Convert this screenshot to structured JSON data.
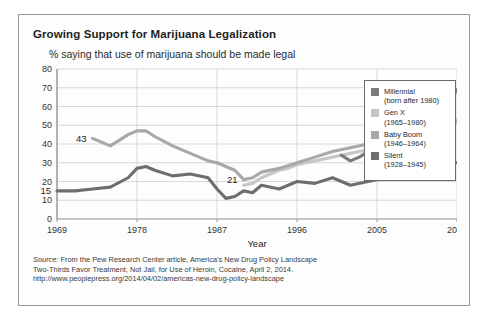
{
  "chart_data": {
    "type": "line",
    "title": "Growing Support for Marijuana Legalization",
    "subtitle": "% saying that use of marijuana should be made legal",
    "xlabel": "Year",
    "ylabel": "",
    "xlim": [
      1969,
      2014
    ],
    "ylim": [
      0,
      80
    ],
    "yticks": [
      "0",
      "10",
      "20",
      "30",
      "40",
      "50",
      "60",
      "70",
      "80"
    ],
    "xticks": [
      "1969",
      "1978",
      "1987",
      "1996",
      "2005",
      "2014"
    ],
    "grid": true,
    "legend_position": "right",
    "series": [
      {
        "name": "Millennial",
        "sublabel": "(born after 1980)",
        "color": "#7a7a7a",
        "end_label": "69",
        "x": [
          2001,
          2002,
          2003,
          2004,
          2005,
          2006,
          2007,
          2008,
          2009,
          2010,
          2011,
          2012,
          2013,
          2014
        ],
        "values": [
          34,
          31,
          33,
          36,
          34,
          34,
          36,
          36,
          42,
          48,
          51,
          58,
          62,
          69
        ]
      },
      {
        "name": "Gen X",
        "sublabel": "(1965–1980)",
        "color": "#c6c6c6",
        "end_label": "53",
        "x": [
          1990,
          1991,
          1992,
          1993,
          1994,
          1995,
          1996,
          1997,
          1998,
          1999,
          2000,
          2001,
          2002,
          2003,
          2004,
          2005,
          2006,
          2007,
          2008,
          2009,
          2010,
          2011,
          2012,
          2013,
          2014
        ],
        "values": [
          18,
          19,
          22,
          24,
          26,
          27,
          29,
          30,
          31,
          32,
          33,
          34,
          35,
          36,
          37,
          38,
          40,
          41,
          40,
          42,
          44,
          45,
          47,
          50,
          53
        ]
      },
      {
        "name": "Baby Boom",
        "sublabel": "(1946–1964)",
        "color": "#a8a8a8",
        "start_label": "43",
        "mid_label": "21",
        "end_label": "52",
        "x": [
          1973,
          1975,
          1977,
          1978,
          1979,
          1980,
          1982,
          1984,
          1986,
          1987,
          1988,
          1989,
          1990,
          1991,
          1992,
          1994,
          1996,
          1998,
          2000,
          2002,
          2004,
          2005,
          2006,
          2007,
          2008,
          2009,
          2010,
          2011,
          2012,
          2013,
          2014
        ],
        "values": [
          43,
          39,
          45,
          47,
          47,
          44,
          39,
          35,
          31,
          30,
          28,
          26,
          21,
          22,
          25,
          27,
          30,
          33,
          36,
          38,
          40,
          41,
          41,
          40,
          38,
          39,
          42,
          44,
          46,
          49,
          52
        ]
      },
      {
        "name": "Silent",
        "sublabel": "(1928–1945)",
        "color": "#6e6e6e",
        "start_label": "15",
        "end_label": "30",
        "x": [
          1969,
          1971,
          1973,
          1975,
          1977,
          1978,
          1979,
          1980,
          1982,
          1984,
          1986,
          1987,
          1988,
          1989,
          1990,
          1991,
          1992,
          1994,
          1996,
          1998,
          2000,
          2002,
          2004,
          2006,
          2008,
          2010,
          2012,
          2013,
          2014
        ],
        "values": [
          15,
          15,
          16,
          17,
          22,
          27,
          28,
          26,
          23,
          24,
          22,
          16,
          11,
          12,
          15,
          14,
          18,
          16,
          20,
          19,
          22,
          18,
          20,
          22,
          23,
          25,
          27,
          31,
          30
        ]
      }
    ],
    "annotations": [
      {
        "text": "43",
        "series": "Baby Boom",
        "x": 1973,
        "y": 43
      },
      {
        "text": "15",
        "series": "Silent",
        "x": 1969,
        "y": 15
      },
      {
        "text": "21",
        "series": "Baby Boom",
        "x": 1990,
        "y": 21
      },
      {
        "text": "34",
        "series": "Millennial",
        "x": 2006,
        "y": 34
      },
      {
        "text": "69",
        "series": "Millennial",
        "x": 2014,
        "y": 69
      },
      {
        "text": "53",
        "series": "Gen X",
        "x": 2014,
        "y": 53
      },
      {
        "text": "52",
        "series": "Baby Boom",
        "x": 2014,
        "y": 52
      },
      {
        "text": "30",
        "series": "Silent",
        "x": 2014,
        "y": 30
      }
    ]
  },
  "source": {
    "label": "Source:",
    "line1": " From the Pew Research Center article, America's New Drug Policy Landscape",
    "line2": "Two-Thirds Favor Treatment, Not Jail, for Use of Heroin, Cocaine, April 2, 2014.",
    "line3": "http://www.peoplepress.org/2014/04/02/americas-new-drug-policy-landscape"
  }
}
